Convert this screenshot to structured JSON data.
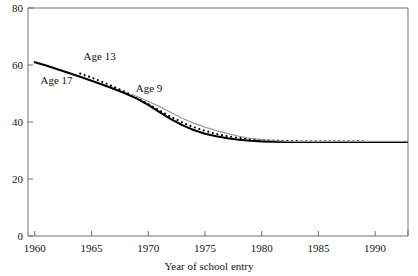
{
  "chart_data": {
    "type": "line",
    "title": "",
    "xlabel": "Year of school entry",
    "ylabel": "",
    "xlim": [
      1959.4,
      1992.9
    ],
    "ylim": [
      0,
      80
    ],
    "grid": false,
    "legend": "inline-labels",
    "xticks": [
      1960,
      1965,
      1970,
      1975,
      1980,
      1985,
      1990
    ],
    "xtick_labels": [
      "1960",
      "1965",
      "1970",
      "1975",
      "1980",
      "1985",
      "1990"
    ],
    "yticks": [
      0,
      20,
      40,
      60,
      80
    ],
    "ytick_labels": [
      "0",
      "20",
      "40",
      "60",
      "80"
    ],
    "series": [
      {
        "name": "Age 17",
        "style": "solid",
        "color": "#000000",
        "width": 2.1,
        "label_text": "Age 17",
        "label_x": 1960.5,
        "label_y": 54.5,
        "x": [
          1960,
          1961,
          1962,
          1963,
          1964,
          1965,
          1966,
          1967,
          1968,
          1969,
          1970,
          1971,
          1972,
          1973,
          1974,
          1975,
          1976,
          1977,
          1978,
          1979,
          1980,
          1981,
          1982,
          1983,
          1984,
          1985,
          1986,
          1987,
          1988,
          1989,
          1990,
          1991,
          1992,
          1992.8
        ],
        "y": [
          61.0,
          59.8,
          58.5,
          57.2,
          55.9,
          54.5,
          53.1,
          51.6,
          50.0,
          48.2,
          46.0,
          43.5,
          41.0,
          38.9,
          37.2,
          35.9,
          35.0,
          34.3,
          33.8,
          33.4,
          33.2,
          33.1,
          33.0,
          33.0,
          33.0,
          33.0,
          33.0,
          33.0,
          33.0,
          33.0,
          33.0,
          33.0,
          33.0,
          33.0
        ]
      },
      {
        "name": "Age 13",
        "style": "dotted",
        "color": "#000000",
        "width": 2.1,
        "label_text": "Age 13",
        "label_x": 1964.3,
        "label_y": 63.0,
        "x": [
          1964,
          1965,
          1966,
          1967,
          1968,
          1969,
          1970,
          1971,
          1972,
          1973,
          1974,
          1975,
          1976,
          1977,
          1978,
          1979,
          1980,
          1981,
          1982,
          1983,
          1984,
          1985,
          1986,
          1987,
          1988,
          1988.9
        ],
        "y": [
          57.0,
          55.6,
          54.0,
          52.3,
          50.5,
          48.5,
          46.3,
          44.0,
          41.8,
          39.8,
          38.2,
          36.9,
          35.8,
          35.0,
          34.4,
          34.0,
          33.7,
          33.5,
          33.4,
          33.3,
          33.2,
          33.2,
          33.2,
          33.2,
          33.2,
          33.2
        ]
      },
      {
        "name": "Age 9",
        "style": "solid",
        "color": "#9a9a9a",
        "width": 1.2,
        "label_text": "Age 9",
        "label_x": 1968.9,
        "label_y": 51.5,
        "x": [
          1968.6,
          1969,
          1970,
          1971,
          1972,
          1973,
          1974,
          1975,
          1976,
          1977,
          1978,
          1979,
          1980,
          1981,
          1982,
          1983,
          1984,
          1985,
          1986,
          1987,
          1988,
          1989,
          1990,
          1991,
          1992,
          1992.8
        ],
        "y": [
          49.5,
          48.9,
          47.3,
          45.4,
          43.3,
          41.3,
          39.6,
          38.2,
          37.0,
          35.9,
          35.0,
          34.3,
          33.8,
          33.5,
          33.3,
          33.2,
          33.2,
          33.2,
          33.2,
          33.2,
          33.2,
          33.2,
          33.2,
          33.2,
          33.2,
          33.2
        ]
      }
    ]
  }
}
